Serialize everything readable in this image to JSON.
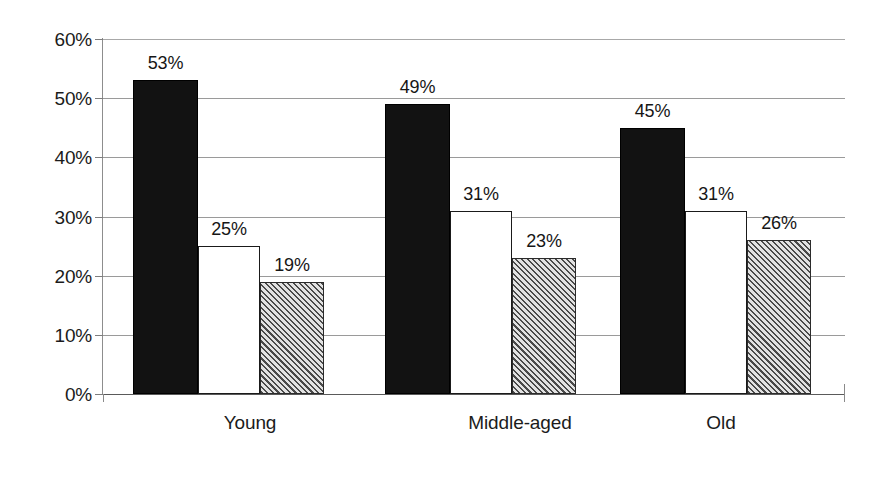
{
  "chart_data": {
    "type": "bar",
    "title": "",
    "subtitle": "",
    "xlabel": "",
    "ylabel": "",
    "categories": [
      "Young",
      "Middle-aged",
      "Old"
    ],
    "series": [
      {
        "name": "series-1",
        "style": "solid-black",
        "color": "#121212",
        "values": [
          53,
          49,
          45
        ],
        "labels": [
          "53%",
          "49%",
          "45%"
        ]
      },
      {
        "name": "series-2",
        "style": "outlined-white",
        "color": "#ffffff",
        "values": [
          25,
          31,
          31
        ],
        "labels": [
          "25%",
          "31%",
          "31%"
        ]
      },
      {
        "name": "series-3",
        "style": "diagonal-hatch-gray",
        "color": "#b5b5b5",
        "values": [
          19,
          23,
          26
        ],
        "labels": [
          "19%",
          "23%",
          "26%"
        ]
      }
    ],
    "ylim": [
      0,
      60
    ],
    "ytick_values": [
      0,
      10,
      20,
      30,
      40,
      50,
      60
    ],
    "ytick_labels": [
      "0%",
      "10%",
      "20%",
      "30%",
      "40%",
      "50%",
      "60%"
    ],
    "grid": true,
    "grid_axis": "y",
    "legend": false,
    "legend_position": "none",
    "value_labels": true,
    "background_color": "#ffffff",
    "gridline_color": "#9a9a9a",
    "axis_color": "#8d8d8d",
    "text_color": "#1b1b1b"
  }
}
